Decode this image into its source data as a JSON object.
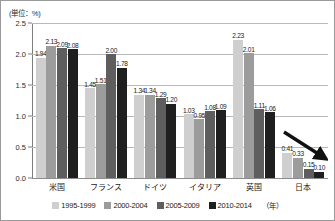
{
  "chart": {
    "unit_label": "(単位：%)",
    "legend_note": "（年）"
  },
  "chart_data": {
    "type": "bar",
    "title": "",
    "xlabel": "",
    "ylabel": "",
    "unit": "%",
    "ylim": [
      0.0,
      2.5
    ],
    "yticks": [
      "0.0",
      "0.5",
      "1.0",
      "1.5",
      "2.0",
      "2.5"
    ],
    "ytick_values": [
      0.0,
      0.5,
      1.0,
      1.5,
      2.0,
      2.5
    ],
    "grid": true,
    "legend_position": "bottom",
    "categories": [
      "米国",
      "フランス",
      "ドイツ",
      "イタリア",
      "英国",
      "日本"
    ],
    "series": [
      {
        "name": "1995-1999",
        "color": "#cfcfcf",
        "values": [
          1.94,
          1.45,
          1.34,
          1.03,
          2.23,
          0.41
        ]
      },
      {
        "name": "2000-2004",
        "color": "#9c9c9c",
        "values": [
          2.13,
          1.51,
          1.34,
          0.95,
          2.01,
          0.33
        ]
      },
      {
        "name": "2005-2009",
        "color": "#5e5e5e",
        "values": [
          2.09,
          2.0,
          1.29,
          1.08,
          1.11,
          0.15
        ]
      },
      {
        "name": "2010-2014",
        "color": "#1f1f1f",
        "values": [
          2.08,
          1.78,
          1.2,
          1.09,
          1.06,
          0.1
        ]
      }
    ],
    "annotations": [
      {
        "name": "decline-arrow",
        "shape": "arrow",
        "direction": "down-right"
      }
    ]
  }
}
